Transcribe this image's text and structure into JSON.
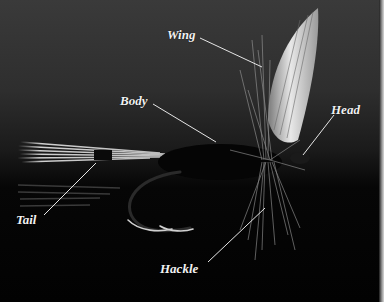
{
  "figure": {
    "labels": {
      "wing": "Wing",
      "body": "Body",
      "head": "Head",
      "tail": "Tail",
      "hackle": "Hackle"
    }
  }
}
